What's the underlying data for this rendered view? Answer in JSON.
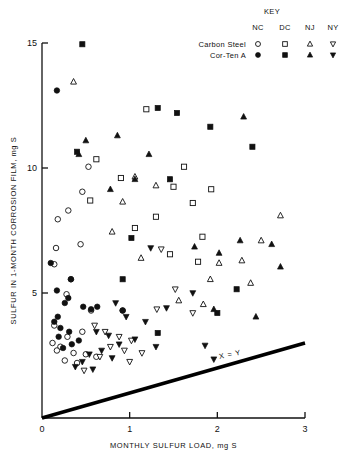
{
  "chart_data": {
    "type": "scatter",
    "title": "",
    "xlabel": "MONTHLY SULFUR LOAD, mg S",
    "ylabel": "SULFUR IN 1-MONTH CORROSION FILM, mg S",
    "xlim": [
      0,
      3
    ],
    "ylim": [
      0,
      15
    ],
    "xticks": [
      0,
      1,
      2,
      3
    ],
    "xticklabels": [
      "0",
      "1",
      "2",
      "3"
    ],
    "yticks": [
      5,
      10,
      15
    ],
    "yticklabels": [
      "5",
      "10",
      "15"
    ],
    "grid": false,
    "legend": {
      "title": "KEY",
      "position": "top-right",
      "columns": [
        "NC",
        "DC",
        "NJ",
        "NY"
      ],
      "rows": [
        {
          "label": "Carbon Steel",
          "fill": "open",
          "markers": [
            "circle",
            "square",
            "triangle-up",
            "triangle-down"
          ]
        },
        {
          "label": "Cor-Ten A",
          "fill": "filled",
          "markers": [
            "circle",
            "square",
            "triangle-up",
            "triangle-down"
          ]
        }
      ]
    },
    "annotations": [
      {
        "text": "X = Y",
        "x": 2.15,
        "y": 2.45,
        "rotation": -11
      }
    ],
    "reference_line": {
      "label": "X = Y",
      "slope": 1.0,
      "intercept": 0.0,
      "x_start": 0.0,
      "y_start": 0.0,
      "x_end": 3.0,
      "y_end": 3.0,
      "linewidth": 3.5,
      "color": "#000000"
    },
    "series": [
      {
        "name": "Carbon Steel NC",
        "marker": "circle",
        "fill": "open",
        "color": "#000000",
        "points": [
          [
            0.53,
            10.05
          ],
          [
            0.46,
            9.05
          ],
          [
            0.3,
            8.3
          ],
          [
            0.18,
            7.95
          ],
          [
            0.44,
            6.95
          ],
          [
            0.16,
            6.8
          ],
          [
            0.14,
            6.15
          ],
          [
            0.33,
            5.55
          ],
          [
            0.28,
            4.95
          ],
          [
            0.56,
            4.3
          ],
          [
            0.92,
            4.3
          ],
          [
            0.14,
            3.7
          ],
          [
            0.46,
            3.45
          ],
          [
            0.29,
            3.25
          ],
          [
            0.12,
            3.0
          ],
          [
            0.21,
            2.85
          ],
          [
            0.17,
            2.7
          ],
          [
            0.36,
            2.6
          ],
          [
            0.5,
            2.55
          ],
          [
            0.62,
            2.45
          ],
          [
            0.26,
            2.3
          ],
          [
            0.4,
            2.2
          ]
        ]
      },
      {
        "name": "Carbon Steel DC",
        "marker": "square",
        "fill": "open",
        "color": "#000000",
        "points": [
          [
            1.19,
            12.35
          ],
          [
            0.62,
            10.35
          ],
          [
            1.62,
            10.05
          ],
          [
            0.9,
            9.6
          ],
          [
            1.5,
            9.25
          ],
          [
            1.93,
            9.15
          ],
          [
            0.55,
            8.7
          ],
          [
            1.72,
            8.6
          ],
          [
            1.3,
            8.05
          ],
          [
            1.06,
            7.6
          ],
          [
            1.83,
            7.25
          ],
          [
            1.46,
            6.55
          ],
          [
            1.78,
            6.25
          ]
        ]
      },
      {
        "name": "Carbon Steel NJ",
        "marker": "triangle-up",
        "fill": "open",
        "color": "#000000",
        "points": [
          [
            0.36,
            13.45
          ],
          [
            1.06,
            9.65
          ],
          [
            1.3,
            9.3
          ],
          [
            0.92,
            8.65
          ],
          [
            2.72,
            8.1
          ],
          [
            0.8,
            7.45
          ],
          [
            2.5,
            7.1
          ],
          [
            1.13,
            6.4
          ],
          [
            2.28,
            6.3
          ],
          [
            2.02,
            6.2
          ],
          [
            1.92,
            5.55
          ],
          [
            2.38,
            5.4
          ],
          [
            1.56,
            4.7
          ],
          [
            1.84,
            4.55
          ]
        ]
      },
      {
        "name": "Carbon Steel NY",
        "marker": "triangle-down",
        "fill": "open",
        "color": "#000000",
        "points": [
          [
            1.36,
            6.75
          ],
          [
            1.52,
            5.15
          ],
          [
            1.31,
            4.35
          ],
          [
            1.72,
            4.2
          ],
          [
            0.6,
            3.7
          ],
          [
            0.72,
            3.45
          ],
          [
            0.88,
            3.25
          ],
          [
            1.02,
            3.1
          ],
          [
            0.78,
            2.85
          ],
          [
            0.94,
            2.7
          ],
          [
            1.14,
            2.6
          ],
          [
            0.66,
            2.45
          ],
          [
            1.0,
            2.25
          ],
          [
            0.48,
            1.9
          ]
        ]
      },
      {
        "name": "Cor-Ten A NC",
        "marker": "circle",
        "fill": "filled",
        "color": "#000000",
        "points": [
          [
            0.17,
            13.1
          ],
          [
            0.1,
            6.2
          ],
          [
            0.33,
            5.55
          ],
          [
            0.17,
            5.1
          ],
          [
            0.3,
            4.8
          ],
          [
            0.26,
            4.6
          ],
          [
            0.47,
            4.45
          ],
          [
            0.63,
            4.45
          ],
          [
            0.18,
            4.05
          ],
          [
            0.92,
            4.3
          ],
          [
            0.21,
            3.6
          ],
          [
            0.31,
            3.45
          ],
          [
            0.19,
            3.25
          ],
          [
            0.42,
            3.1
          ],
          [
            0.34,
            2.95
          ],
          [
            0.24,
            2.8
          ],
          [
            0.56,
            4.35
          ],
          [
            0.14,
            3.85
          ]
        ]
      },
      {
        "name": "Cor-Ten A DC",
        "marker": "square",
        "fill": "filled",
        "color": "#000000",
        "points": [
          [
            0.46,
            14.95
          ],
          [
            1.32,
            12.4
          ],
          [
            1.54,
            12.2
          ],
          [
            1.92,
            11.65
          ],
          [
            0.4,
            10.65
          ],
          [
            2.4,
            10.85
          ],
          [
            1.46,
            9.55
          ],
          [
            1.02,
            7.2
          ],
          [
            0.92,
            5.55
          ],
          [
            2.22,
            5.15
          ],
          [
            2.0,
            4.2
          ],
          [
            1.32,
            3.4
          ]
        ]
      },
      {
        "name": "Cor-Ten A NJ",
        "marker": "triangle-up",
        "fill": "filled",
        "color": "#000000",
        "points": [
          [
            0.5,
            11.1
          ],
          [
            0.86,
            11.3
          ],
          [
            0.42,
            10.55
          ],
          [
            1.22,
            10.55
          ],
          [
            1.06,
            9.55
          ],
          [
            0.78,
            9.15
          ],
          [
            2.3,
            12.05
          ],
          [
            2.62,
            6.95
          ],
          [
            2.02,
            6.6
          ],
          [
            2.26,
            7.1
          ],
          [
            1.74,
            6.85
          ],
          [
            2.72,
            6.05
          ],
          [
            2.44,
            4.05
          ],
          [
            1.96,
            4.35
          ]
        ]
      },
      {
        "name": "Cor-Ten A NY",
        "marker": "triangle-down",
        "fill": "filled",
        "color": "#000000",
        "points": [
          [
            1.24,
            6.8
          ],
          [
            1.72,
            5.0
          ],
          [
            0.84,
            4.6
          ],
          [
            1.42,
            4.4
          ],
          [
            0.96,
            4.05
          ],
          [
            1.18,
            3.85
          ],
          [
            0.62,
            3.45
          ],
          [
            0.76,
            3.3
          ],
          [
            1.06,
            3.15
          ],
          [
            0.88,
            2.95
          ],
          [
            1.3,
            2.85
          ],
          [
            0.68,
            2.7
          ],
          [
            0.54,
            2.55
          ],
          [
            0.8,
            2.4
          ],
          [
            0.46,
            2.25
          ],
          [
            1.96,
            2.35
          ],
          [
            1.86,
            2.9
          ],
          [
            0.38,
            2.05
          ],
          [
            0.58,
            1.95
          ]
        ]
      }
    ]
  }
}
